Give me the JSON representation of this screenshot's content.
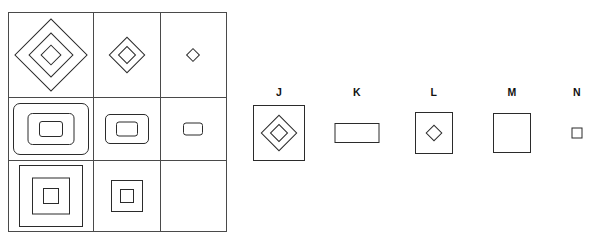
{
  "puzzle": {
    "type": "visual-analogy-matrix",
    "title": "",
    "matrix": {
      "rows": 3,
      "columns": 3,
      "cells": [
        {
          "id": "cell-1-1",
          "row": 1,
          "col": 1,
          "shape": "diamond",
          "nesting_count": 3,
          "size": "large",
          "empty": false,
          "description": "three nested diamonds, large"
        },
        {
          "id": "cell-1-2",
          "row": 1,
          "col": 2,
          "shape": "diamond",
          "nesting_count": 2,
          "size": "medium",
          "empty": false,
          "description": "two nested diamonds, medium"
        },
        {
          "id": "cell-1-3",
          "row": 1,
          "col": 3,
          "shape": "diamond",
          "nesting_count": 1,
          "size": "small",
          "empty": false,
          "description": "one small diamond"
        },
        {
          "id": "cell-2-1",
          "row": 2,
          "col": 1,
          "shape": "rounded-rectangle",
          "nesting_count": 3,
          "size": "large",
          "empty": false,
          "description": "three nested rounded rectangles, large"
        },
        {
          "id": "cell-2-2",
          "row": 2,
          "col": 2,
          "shape": "rounded-rectangle",
          "nesting_count": 2,
          "size": "medium",
          "empty": false,
          "description": "two nested rounded rectangles, medium"
        },
        {
          "id": "cell-2-3",
          "row": 2,
          "col": 3,
          "shape": "rounded-rectangle",
          "nesting_count": 1,
          "size": "small",
          "empty": false,
          "description": "one small rounded rectangle"
        },
        {
          "id": "cell-3-1",
          "row": 3,
          "col": 1,
          "shape": "square",
          "nesting_count": 3,
          "size": "large",
          "empty": false,
          "description": "three nested squares, large"
        },
        {
          "id": "cell-3-2",
          "row": 3,
          "col": 2,
          "shape": "square",
          "nesting_count": 2,
          "size": "medium",
          "empty": false,
          "description": "two nested squares, medium"
        },
        {
          "id": "cell-3-3",
          "row": 3,
          "col": 3,
          "shape": "none",
          "nesting_count": 0,
          "size": "none",
          "empty": true,
          "description": "blank answer cell"
        }
      ]
    },
    "options": [
      {
        "id": "option-j",
        "label": "J",
        "outer_shape": "square",
        "inner_shape": "diamond",
        "inner_count": 2,
        "description": "square frame containing two nested diamonds"
      },
      {
        "id": "option-k",
        "label": "K",
        "outer_shape": "rectangle",
        "inner_shape": "none",
        "inner_count": 0,
        "description": "empty wide rectangle"
      },
      {
        "id": "option-l",
        "label": "L",
        "outer_shape": "square",
        "inner_shape": "diamond",
        "inner_count": 1,
        "description": "square frame containing one small diamond"
      },
      {
        "id": "option-m",
        "label": "M",
        "outer_shape": "square",
        "inner_shape": "none",
        "inner_count": 0,
        "description": "empty square"
      },
      {
        "id": "option-n",
        "label": "N",
        "outer_shape": "square",
        "inner_shape": "none",
        "inner_count": 0,
        "description": "small empty square"
      }
    ]
  },
  "colors": {
    "stroke": "#2b2b2b",
    "grid_line": "#4a4a4a",
    "background": "#ffffff",
    "text": "#111111"
  }
}
